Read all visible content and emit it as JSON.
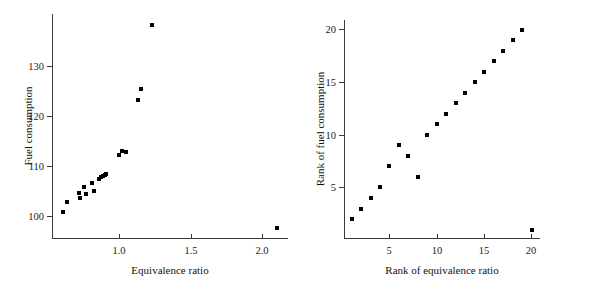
{
  "chart_data": [
    {
      "type": "scatter",
      "panel": "left",
      "title": "",
      "xlabel": "Equivalence ratio",
      "ylabel": "Fuel consumption",
      "xlim": [
        0.53,
        2.18
      ],
      "ylim": [
        95.5,
        140.5
      ],
      "xticks": [
        1.0,
        1.5,
        2.0
      ],
      "xticklabels": [
        "1.0",
        "1.5",
        "2.0"
      ],
      "yticks": [
        100,
        110,
        120,
        130
      ],
      "yticklabels": [
        "100",
        "110",
        "120",
        "130"
      ],
      "grid": false,
      "legend": "none",
      "x": [
        0.607,
        0.632,
        0.715,
        0.724,
        0.753,
        0.77,
        0.806,
        0.82,
        0.857,
        0.875,
        0.888,
        0.898,
        0.904,
        1.001,
        1.02,
        1.046,
        1.133,
        1.155,
        1.229,
        2.1
      ],
      "y": [
        100.7,
        102.7,
        104.6,
        103.5,
        105.8,
        104.4,
        106.6,
        105.0,
        107.4,
        107.7,
        108.0,
        108.2,
        108.4,
        112.1,
        113.0,
        112.8,
        123.3,
        125.4,
        138.3,
        97.5
      ]
    },
    {
      "type": "scatter",
      "panel": "right",
      "title": "",
      "xlabel": "Rank of equivalence ratio",
      "ylabel": "Rank of fuel consumption",
      "xlim": [
        0.2,
        20.9
      ],
      "ylim": [
        0.2,
        20.9
      ],
      "xticks": [
        5,
        10,
        15,
        20
      ],
      "xticklabels": [
        "5",
        "10",
        "15",
        "20"
      ],
      "yticks": [
        5,
        10,
        15,
        20
      ],
      "yticklabels": [
        "5",
        "10",
        "15",
        "20"
      ],
      "grid": false,
      "legend": "none",
      "x": [
        1,
        2,
        3,
        4,
        5,
        6,
        7,
        8,
        9,
        10,
        11,
        12,
        13,
        14,
        15,
        16,
        17,
        18,
        19,
        20
      ],
      "y": [
        2,
        3,
        4,
        5,
        7,
        9,
        8,
        6,
        10,
        11,
        12,
        13,
        14,
        15,
        16,
        17,
        18,
        19,
        20,
        1
      ]
    }
  ]
}
